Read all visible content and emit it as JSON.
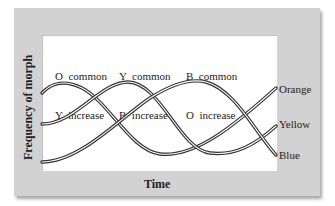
{
  "figure": {
    "y_axis_label": "Frequency of morph",
    "x_axis_label": "Time",
    "phases": [
      {
        "line1": "O  common",
        "line2": "Y  increase"
      },
      {
        "line1": "Y  common",
        "line2": "B  increase"
      },
      {
        "line1": "B  common",
        "line2": "O  increase"
      }
    ],
    "series_labels": {
      "orange": "Orange",
      "yellow": "Yellow",
      "blue": "Blue"
    }
  },
  "colors": {
    "panel": "#d2d2d2",
    "plot_bg": "#ffffff",
    "curve_outline": "#333333",
    "curve_core": "#ffffff",
    "text": "#222222"
  }
}
